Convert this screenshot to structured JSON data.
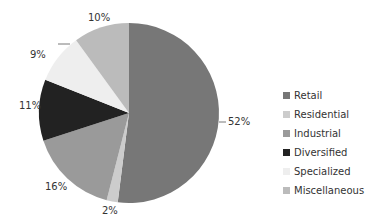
{
  "chart_data": {
    "type": "pie",
    "title": "",
    "categories": [
      "Retail",
      "Residential",
      "Industrial",
      "Diversified",
      "Specialized",
      "Miscellaneous"
    ],
    "values": [
      52,
      2,
      16,
      11,
      9,
      10
    ],
    "labels": [
      "52%",
      "2%",
      "16%",
      "11%",
      "9%",
      "10%"
    ],
    "colors": [
      "#777777",
      "#cccccc",
      "#9a9a9a",
      "#222222",
      "#eeeeee",
      "#bbbbbb"
    ],
    "legend_position": "right",
    "start_angle": "top, clockwise"
  }
}
